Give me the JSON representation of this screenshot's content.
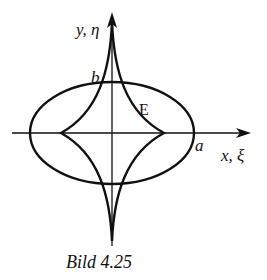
{
  "figure": {
    "caption": "Bild 4.25",
    "y_axis_label": "y, η",
    "x_axis_label": "x, ξ",
    "point_b_label": "b",
    "point_a_label": "a",
    "curve_label": "E"
  },
  "colors": {
    "stroke": "#111111",
    "background": "#ffffff"
  }
}
